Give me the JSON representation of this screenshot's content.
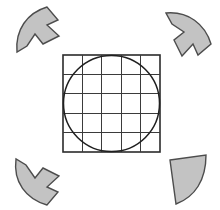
{
  "figure": {
    "background_color": "#ffffff",
    "caption": ""
  },
  "colors": {
    "wedge_fill": "#c3c3c3",
    "wedge_stroke": "#4d4d4d",
    "grid_stroke": "#3b3b3b",
    "square_stroke": "#2b2b2b",
    "circle_stroke": "#1f1f1f",
    "background": "#ffffff"
  },
  "grid": {
    "label": "5 by 5 square grid",
    "columns": 5,
    "rows": 5,
    "x": 63,
    "y": 55,
    "width": 97,
    "height": 97,
    "cell_size": 19.4,
    "outer_stroke_width": 1.6,
    "inner_stroke_width": 1.1
  },
  "circle": {
    "label": "inscribed circle",
    "cx": 111.5,
    "cy": 103.5,
    "r": 48,
    "stroke_width": 1.5,
    "fill": "none"
  },
  "wedges": [
    {
      "name": "top-left-arrow",
      "position": "top-left",
      "notched": true,
      "fill": "#c3c3c3",
      "stroke": "#4d4d4d",
      "stroke_width": 1.4,
      "path": "M 17 52 C 15 30 27 13 47 7 L 58 20 L 47 25 L 59 36 L 43 44 L 35 34 L 27 46 Z"
    },
    {
      "name": "top-right-arrow",
      "position": "top-right",
      "notched": true,
      "fill": "#c3c3c3",
      "stroke": "#4d4d4d",
      "stroke_width": 1.4,
      "path": "M 166 13 C 188 11 205 24 211 44 L 198 55 L 193 44 L 182 56 L 174 40 L 184 32 L 172 24 Z"
    },
    {
      "name": "bottom-left-arrow",
      "position": "bottom-left",
      "notched": true,
      "fill": "#c3c3c3",
      "stroke": "#4d4d4d",
      "stroke_width": 1.4,
      "path": "M 16 159 C 13 182 26 199 47 205 L 58 192 L 47 187 L 59 176 L 43 168 L 35 178 L 26 165 Z"
    },
    {
      "name": "bottom-right-wedge",
      "position": "bottom-right",
      "notched": false,
      "fill": "#c3c3c3",
      "stroke": "#4d4d4d",
      "stroke_width": 1.4,
      "path": "M 170 160 L 206 155 C 206 180 195 197 176 204 Z"
    }
  ]
}
